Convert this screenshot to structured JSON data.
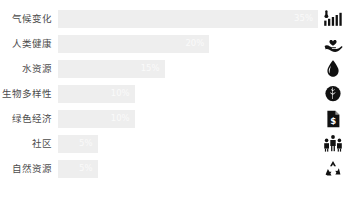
{
  "chart_data": {
    "type": "bar",
    "orientation": "horizontal",
    "title": "",
    "xlabel": "",
    "ylabel": "",
    "xlim": [
      0,
      35
    ],
    "grid": false,
    "legend": false,
    "categories": [
      "气候变化",
      "人类健康",
      "水资源",
      "生物多样性",
      "绿色经济",
      "社区",
      "自然资源"
    ],
    "values": [
      35,
      20,
      15,
      10,
      10,
      5,
      5
    ],
    "value_labels": [
      "35%",
      "20%",
      "15%",
      "10%",
      "10%",
      "5%",
      "5%"
    ],
    "bar_color": "#eeeeee",
    "value_label_color": "#fafafa",
    "label_color": "#4c4c4c",
    "background": "#ffffff",
    "rows": [
      {
        "label": "气候变化",
        "value": 35,
        "value_label": "35%",
        "width_pct": 100,
        "icon": "thermometer-bars-icon"
      },
      {
        "label": "人类健康",
        "value": 20,
        "value_label": "20%",
        "width_pct": 58.2,
        "icon": "hand-heart-icon"
      },
      {
        "label": "水资源",
        "value": 15,
        "value_label": "15%",
        "width_pct": 41.0,
        "icon": "water-drop-icon"
      },
      {
        "label": "生物多样性",
        "value": 10,
        "value_label": "10%",
        "width_pct": 29.5,
        "icon": "leaf-circle-icon"
      },
      {
        "label": "绿色经济",
        "value": 10,
        "value_label": "10%",
        "width_pct": 29.5,
        "icon": "document-dollar-icon"
      },
      {
        "label": "社区",
        "value": 5,
        "value_label": "5%",
        "width_pct": 15.2,
        "icon": "people-group-icon"
      },
      {
        "label": "自然资源",
        "value": 5,
        "value_label": "5%",
        "width_pct": 15.2,
        "icon": "recycle-icon"
      }
    ]
  }
}
